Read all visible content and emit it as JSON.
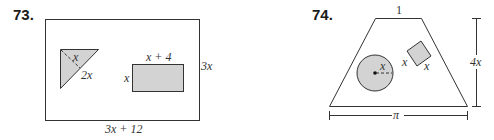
{
  "problems": [
    {
      "number": "73.",
      "outer_rect": {
        "width_label": "3x + 12",
        "height_label": "3x"
      },
      "triangle": {
        "leg_label": "x",
        "hypotenuse_label": "2x"
      },
      "inner_rect": {
        "width_label": "x + 4",
        "height_label": "x"
      }
    },
    {
      "number": "74.",
      "trapezoid": {
        "top_label": "1",
        "bottom_label": "π",
        "height_label": "4x"
      },
      "circle": {
        "radius_label": "x"
      },
      "square": {
        "side1_label": "x",
        "side2_label": "x"
      }
    }
  ],
  "colors": {
    "shade": "#d3d3d3",
    "stroke": "#333333"
  }
}
